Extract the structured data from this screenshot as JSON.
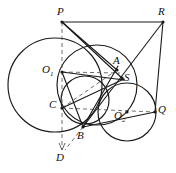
{
  "figure": {
    "kind": "geometry-diagram",
    "title": "",
    "width": 176,
    "height": 173,
    "background_color": "#ffffff",
    "stroke_color": "#1a1a1a",
    "dashed_color": "#555555"
  },
  "points": [
    {
      "id": "P",
      "label": "P",
      "sub": "",
      "x": 62,
      "y": 22,
      "label_x": 57,
      "label_y": 6,
      "dot": true
    },
    {
      "id": "R",
      "label": "R",
      "sub": "",
      "x": 163,
      "y": 22,
      "label_x": 158,
      "label_y": 6,
      "dot": true
    },
    {
      "id": "O1",
      "label": "O",
      "sub": "1",
      "x": 62,
      "y": 72,
      "label_x": 42,
      "label_y": 64,
      "dot": true
    },
    {
      "id": "A",
      "label": "A",
      "sub": "",
      "x": 117,
      "y": 70,
      "label_x": 113,
      "label_y": 55,
      "dot": true
    },
    {
      "id": "S",
      "label": "S",
      "sub": "",
      "x": 122,
      "y": 78,
      "label_x": 124,
      "label_y": 72,
      "dot": true
    },
    {
      "id": "C",
      "label": "C",
      "sub": "",
      "x": 62,
      "y": 108,
      "label_x": 49,
      "label_y": 99,
      "dot": true
    },
    {
      "id": "O2",
      "label": "O",
      "sub": "2",
      "x": 127,
      "y": 112,
      "label_x": 114,
      "label_y": 110,
      "dot": true
    },
    {
      "id": "Q",
      "label": "Q",
      "sub": "",
      "x": 155,
      "y": 112,
      "label_x": 158,
      "label_y": 104,
      "dot": true
    },
    {
      "id": "B",
      "label": "B",
      "sub": "",
      "x": 83,
      "y": 127,
      "label_x": 77,
      "label_y": 130,
      "dot": true
    },
    {
      "id": "D",
      "label": "D",
      "sub": "",
      "x": 62,
      "y": 150,
      "label_x": 56,
      "label_y": 152,
      "dot": false
    }
  ],
  "circles": [
    {
      "id": "big-left-circle",
      "cx": 55,
      "cy": 85,
      "r": 47
    },
    {
      "id": "middle-circle",
      "cx": 97,
      "cy": 85,
      "r": 40
    },
    {
      "id": "right-circle",
      "cx": 127,
      "cy": 112,
      "r": 29
    },
    {
      "id": "small-inner-circle",
      "cx": 85,
      "cy": 100,
      "r": 24
    }
  ],
  "solid_segments": [
    {
      "id": "P-R",
      "x1": 62,
      "y1": 22,
      "x2": 163,
      "y2": 22
    },
    {
      "id": "R-Q",
      "x1": 163,
      "y1": 22,
      "x2": 155,
      "y2": 112
    },
    {
      "id": "P-S",
      "x1": 62,
      "y1": 22,
      "x2": 124,
      "y2": 80
    },
    {
      "id": "P-A",
      "x1": 62,
      "y1": 22,
      "x2": 117,
      "y2": 70
    },
    {
      "id": "R-B",
      "x1": 163,
      "y1": 22,
      "x2": 83,
      "y2": 127
    },
    {
      "id": "O1-S",
      "x1": 62,
      "y1": 72,
      "x2": 124,
      "y2": 80
    },
    {
      "id": "O1-B",
      "x1": 62,
      "y1": 72,
      "x2": 83,
      "y2": 127
    },
    {
      "id": "B-A",
      "x1": 83,
      "y1": 127,
      "x2": 118,
      "y2": 66
    },
    {
      "id": "B-Q",
      "x1": 83,
      "y1": 127,
      "x2": 155,
      "y2": 112
    },
    {
      "id": "C-S",
      "x1": 62,
      "y1": 108,
      "x2": 124,
      "y2": 79
    }
  ],
  "dashed_segments": [
    {
      "id": "P-D",
      "x1": 62,
      "y1": 22,
      "x2": 62,
      "y2": 150,
      "arrow": true
    },
    {
      "id": "O1-A",
      "x1": 62,
      "y1": 72,
      "x2": 120,
      "y2": 73,
      "arrow": false
    },
    {
      "id": "C-Q",
      "x1": 62,
      "y1": 108,
      "x2": 155,
      "y2": 112,
      "arrow": false
    },
    {
      "id": "C-A",
      "x1": 62,
      "y1": 108,
      "x2": 117,
      "y2": 70,
      "arrow": false
    },
    {
      "id": "B-D",
      "x1": 83,
      "y1": 127,
      "x2": 65,
      "y2": 150,
      "arrow": false
    }
  ]
}
